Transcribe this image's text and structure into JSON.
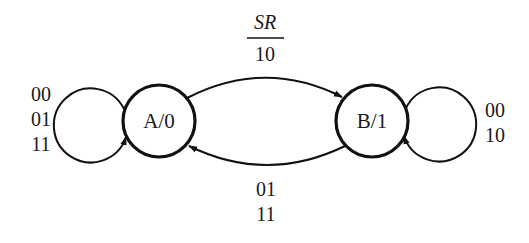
{
  "diagram": {
    "type": "state-diagram",
    "states": [
      {
        "id": "A",
        "label": "A/0",
        "cx": 159,
        "cy": 121,
        "r": 36
      },
      {
        "id": "B",
        "label": "B/1",
        "cx": 372,
        "cy": 121,
        "r": 36
      }
    ],
    "transitions": [
      {
        "from": "A",
        "to": "A",
        "kind": "self-loop",
        "labels": [
          "00",
          "01",
          "11"
        ]
      },
      {
        "from": "A",
        "to": "B",
        "kind": "arc-top",
        "labels": [
          "10"
        ]
      },
      {
        "from": "B",
        "to": "A",
        "kind": "arc-bottom",
        "labels": [
          "01",
          "11"
        ]
      },
      {
        "from": "B",
        "to": "B",
        "kind": "self-loop",
        "labels": [
          "00",
          "10"
        ]
      }
    ],
    "input_header": "SR",
    "top_arc_label": "10",
    "left_loop_labels": [
      "00",
      "01",
      "11"
    ],
    "right_loop_labels": [
      "00",
      "10"
    ],
    "bottom_arc_labels": [
      "01",
      "11"
    ],
    "colors": {
      "stroke": "#111111",
      "background": "#ffffff"
    }
  }
}
